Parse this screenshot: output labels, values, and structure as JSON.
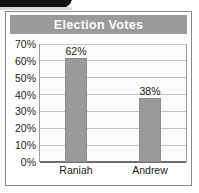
{
  "artifact": {
    "name": "page-edge-artifact"
  },
  "chart_data": {
    "type": "bar",
    "title": "Election Votes",
    "categories": [
      "Raniah",
      "Andrew"
    ],
    "values": [
      62,
      38
    ],
    "value_labels": [
      "62%",
      "38%"
    ],
    "xlabel": "",
    "ylabel": "",
    "ylim": [
      0,
      70
    ],
    "ytick_step": 10,
    "ytick_labels": [
      "0%",
      "10%",
      "20%",
      "30%",
      "40%",
      "50%",
      "60%",
      "70%"
    ],
    "ytick_values": [
      0,
      10,
      20,
      30,
      40,
      50,
      60,
      70
    ],
    "grid": true,
    "grid_orientation": "horizontal",
    "legend": false,
    "legend_position": "none",
    "colors": {
      "bar": "#9a9a9a",
      "bar_border": "#8c8c8c",
      "title_bar": "#9a9a9a",
      "title_text": "#ffffff",
      "gridline": "#c3c3c3",
      "axis": "#6f6f6f",
      "plot_background": "#fbfbfb",
      "frame": "#888888",
      "text": "#1b1b1b"
    }
  }
}
